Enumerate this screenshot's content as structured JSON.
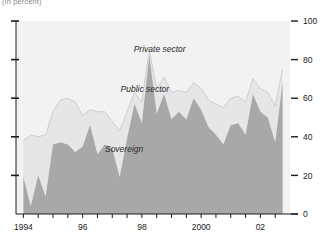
{
  "subtitle": "(In percent)",
  "chart_data": {
    "type": "area",
    "stacked": true,
    "title": "",
    "subtitle": "(In percent)",
    "xlabel": "",
    "ylabel": "",
    "ylim": [
      0,
      100
    ],
    "xlim": [
      1993.75,
      2003.0
    ],
    "grid": false,
    "legend_position": "inline-annotations",
    "y_ticks": [
      0,
      20,
      40,
      60,
      80,
      100
    ],
    "y_tick_labels": [
      "0",
      "20",
      "40",
      "60",
      "80",
      "100"
    ],
    "y_axis_side": "right",
    "left_axis_ticks_unlabeled": true,
    "x_tick_labels": [
      "1994",
      "96",
      "98",
      "2000",
      "02"
    ],
    "x_tick_positions": [
      1994.0,
      1996.0,
      1998.0,
      2000.0,
      2002.0
    ],
    "x_minor_tick_interval": 0.5,
    "colors": {
      "sovereign": "#a8a8a8",
      "public_sector": "#e6e6e6",
      "private_sector": "#f2f2f2",
      "axis": "#1a1a1a",
      "band_outline": "#c9c9c9"
    },
    "annotations": [
      {
        "text": "Private sector",
        "x": 1998.6,
        "y": 84
      },
      {
        "text": "Public sector",
        "x": 1998.1,
        "y": 63
      },
      {
        "text": "Sovereign",
        "x": 1997.4,
        "y": 32
      }
    ],
    "x": [
      1994.0,
      1994.25,
      1994.5,
      1994.75,
      1995.0,
      1995.25,
      1995.5,
      1995.75,
      1996.0,
      1996.25,
      1996.5,
      1996.75,
      1997.0,
      1997.25,
      1997.5,
      1997.75,
      1998.0,
      1998.25,
      1998.5,
      1998.75,
      1999.0,
      1999.25,
      1999.5,
      1999.75,
      2000.0,
      2000.25,
      2000.5,
      2000.75,
      2001.0,
      2001.25,
      2001.5,
      2001.75,
      2002.0,
      2002.25,
      2002.5,
      2002.75
    ],
    "series": [
      {
        "name": "Sovereign",
        "color": "#a8a8a8",
        "values": [
          19,
          4,
          20,
          9,
          36,
          37,
          36,
          32,
          35,
          46,
          31,
          36,
          34,
          19,
          39,
          57,
          47,
          82,
          52,
          62,
          49,
          53,
          49,
          60,
          54,
          45,
          41,
          36,
          46,
          47,
          41,
          62,
          53,
          50,
          37,
          68
        ]
      },
      {
        "name": "Public sector",
        "color": "#e6e6e6",
        "values": [
          19,
          37,
          20,
          32,
          17,
          22,
          24,
          26,
          16,
          8,
          22,
          17,
          14,
          24,
          14,
          6,
          11,
          3,
          13,
          9,
          14,
          11,
          14,
          8,
          11,
          14,
          16,
          19,
          14,
          14,
          17,
          8,
          12,
          13,
          19,
          7
        ]
      },
      {
        "name": "Private sector",
        "color": "#f2f2f2",
        "values": [
          62,
          59,
          60,
          59,
          47,
          41,
          40,
          42,
          49,
          46,
          47,
          47,
          52,
          57,
          47,
          37,
          42,
          15,
          35,
          29,
          37,
          36,
          37,
          32,
          35,
          41,
          43,
          45,
          40,
          39,
          42,
          30,
          35,
          37,
          44,
          25
        ]
      }
    ]
  }
}
